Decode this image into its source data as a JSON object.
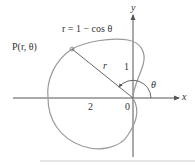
{
  "diagram": {
    "type": "polar-curve",
    "equation_label": "r = 1 − cos θ",
    "point_label": "P(r, θ)",
    "radius_label": "r",
    "angle_label": "θ",
    "axis_labels": {
      "x": "x",
      "y": "y"
    },
    "tick_labels": {
      "two": "2",
      "origin": "0",
      "one": "1"
    },
    "colors": {
      "curve": "#9a9a9a",
      "axes": "#555555",
      "text": "#333333",
      "background": "#ffffff"
    }
  }
}
